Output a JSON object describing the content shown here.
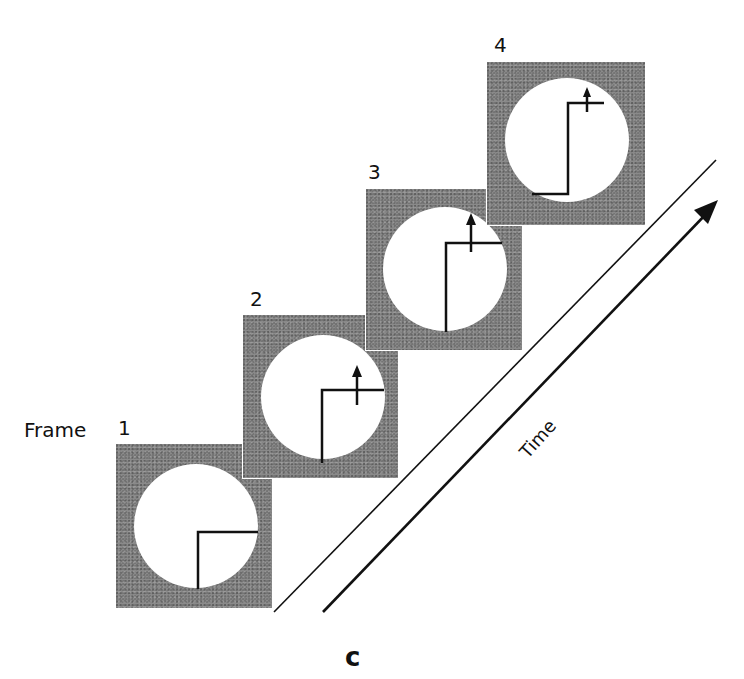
{
  "figure": {
    "frame_label": "Frame",
    "frames": [
      {
        "number": "1",
        "arrow_shown": false
      },
      {
        "number": "2",
        "arrow_shown": true
      },
      {
        "number": "3",
        "arrow_shown": true
      },
      {
        "number": "4",
        "arrow_shown": true
      }
    ],
    "axis_label": "Time",
    "caption": "c",
    "colors": {
      "frame_fill": "#8a8a8a",
      "aperture": "#ffffff",
      "line": "#111111"
    }
  }
}
